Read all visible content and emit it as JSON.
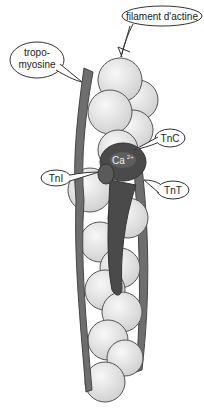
{
  "diagram": {
    "type": "labeled-illustration",
    "labels": {
      "actin": "filament d'actine",
      "tropomyosin_line1": "tropo-",
      "tropomyosin_line2": "myosine",
      "tnc": "TnC",
      "tni": "TnI",
      "tnt": "TnT",
      "calcium": "Ca",
      "calcium_charge": "2+"
    },
    "colors": {
      "actin_bead": "#e0e0e0",
      "actin_stroke": "#555555",
      "tropomyosin": "#6e6e6e",
      "troponin": "#4a4a4a",
      "background": "#ffffff"
    }
  }
}
